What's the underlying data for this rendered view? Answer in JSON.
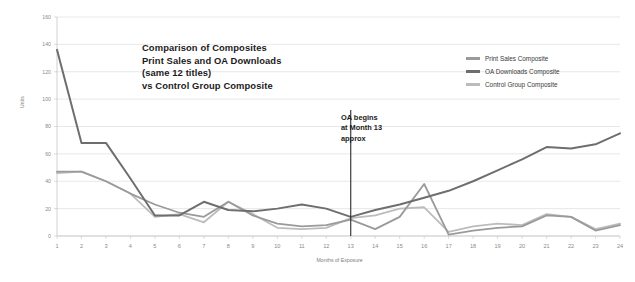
{
  "title_lines": [
    "Comparison of Composites",
    "Print Sales and OA Downloads",
    "(same 12 titles)",
    "vs Control Group Composite"
  ],
  "annotation_lines": [
    "OA begins",
    "at Month 13",
    "approx"
  ],
  "colors": {
    "print_sales": "#9a9a9a",
    "oa_downloads": "#6e6e6e",
    "control_group": "#bcbcbc",
    "gridline": "#d9d9d9",
    "axis": "#bdbdbd",
    "annotation_line": "#2b2b2b",
    "text": "#1b1b1b",
    "tick_text": "#8a8a8a",
    "background": "#ffffff"
  },
  "chart_data": {
    "type": "line",
    "title": "Comparison of Composites Print Sales and OA Downloads (same 12 titles) vs Control Group Composite",
    "xlabel": "Months of Exposure",
    "ylabel": "Units",
    "xlim": [
      1,
      24
    ],
    "ylim": [
      0,
      160
    ],
    "ytick_step": 20,
    "grid": true,
    "legend_position": "top-right",
    "categories": [
      1,
      2,
      3,
      4,
      5,
      6,
      7,
      8,
      9,
      10,
      11,
      12,
      13,
      14,
      15,
      16,
      17,
      18,
      19,
      20,
      21,
      22,
      23,
      24
    ],
    "ytick_labels": [
      "0",
      "20",
      "40",
      "60",
      "80",
      "100",
      "120",
      "140",
      "160"
    ],
    "xtick_labels": [
      "1",
      "2",
      "3",
      "4",
      "5",
      "6",
      "7",
      "8",
      "9",
      "10",
      "11",
      "12",
      "13",
      "14",
      "15",
      "16",
      "17",
      "18",
      "19",
      "20",
      "21",
      "22",
      "23",
      "24"
    ],
    "annotations": [
      {
        "text": "OA begins at Month 13 approx",
        "x": 13,
        "type": "vertical-line"
      }
    ],
    "series": [
      {
        "name": "Print Sales Composite",
        "color": "#9a9a9a",
        "values": [
          47,
          47,
          40,
          31,
          23,
          17,
          14,
          25,
          15,
          9,
          7,
          8,
          12,
          5,
          14,
          38,
          1,
          4,
          6,
          7,
          15,
          14,
          4,
          8
        ]
      },
      {
        "name": "OA Downloads Composite",
        "color": "#6e6e6e",
        "values": [
          136,
          68,
          68,
          42,
          15,
          15,
          25,
          19,
          18,
          20,
          23,
          20,
          14,
          19,
          23,
          28,
          33,
          40,
          48,
          56,
          65,
          64,
          67,
          75
        ]
      },
      {
        "name": "Control Group Composite",
        "color": "#bcbcbc",
        "values": [
          46,
          47,
          40,
          31,
          14,
          16,
          10,
          25,
          16,
          6,
          5,
          6,
          13,
          15,
          20,
          21,
          3,
          7,
          9,
          8,
          16,
          14,
          5,
          9
        ]
      }
    ]
  }
}
